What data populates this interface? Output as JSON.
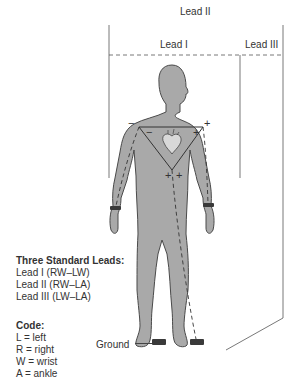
{
  "diagram": {
    "labels": {
      "lead2": "Lead II",
      "lead1": "Lead I",
      "lead3": "Lead III",
      "ground": "Ground"
    },
    "polarity": {
      "right_shoulder": "−",
      "left_shoulder": "+",
      "left_triangle_corner": "−",
      "right_triangle_corner": "+",
      "bottom_left": "+",
      "bottom_right": "+"
    },
    "icons": [
      "heart-icon"
    ],
    "colors": {
      "body_fill": "#a9a9a9",
      "body_outline": "#4a4a4a",
      "electrode_band": "#3a3a3a",
      "lines": "#555555"
    }
  },
  "legend": {
    "leads_title": "Three Standard Leads:",
    "leads": [
      "Lead I (RW–LW)",
      "Lead II (RW–LA)",
      "Lead III (LW–LA)"
    ],
    "code_title": "Code:",
    "codes": [
      "L = left",
      "R = right",
      "W = wrist",
      "A = ankle"
    ]
  }
}
